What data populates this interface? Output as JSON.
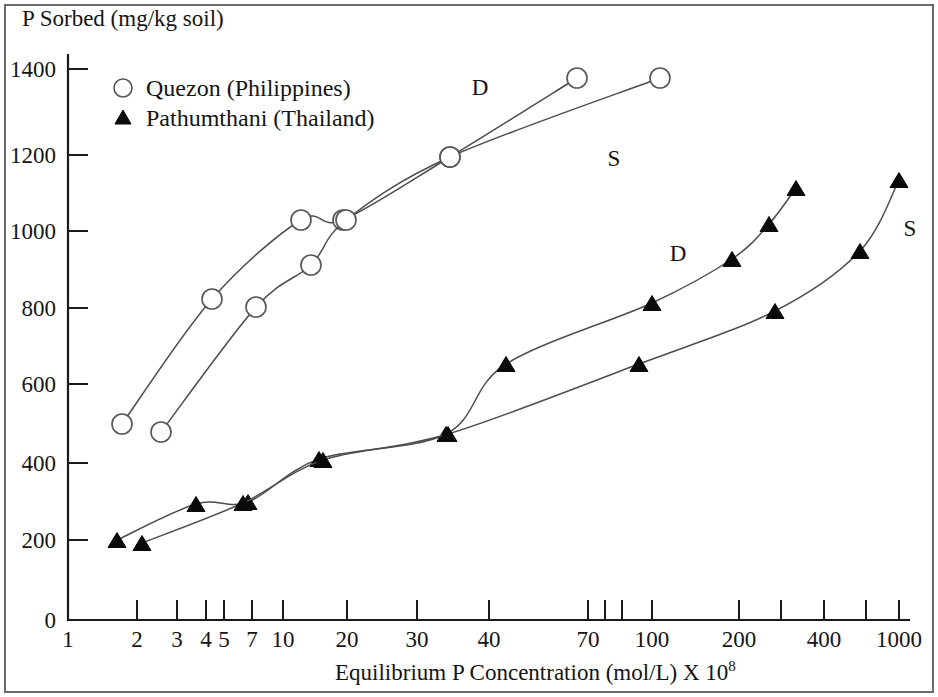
{
  "figure": {
    "y_axis_title": "P Sorbed (mg/kg soil)",
    "x_axis_title_main": "Equilibrium P Concentration (mol/L) X 10",
    "x_axis_title_exponent": "8"
  },
  "legend": {
    "items": [
      {
        "marker": "open-circle-marker",
        "label": "Quezon (Philippines)"
      },
      {
        "marker": "filled-triangle-marker",
        "label": "Pathumthani (Thailand)"
      }
    ]
  },
  "chart_data": {
    "type": "line",
    "title": "",
    "xlabel": "Equilibrium P Concentration (mol/L) X 10^8",
    "ylabel": "P Sorbed (mg/kg soil)",
    "xscale": "log",
    "xlim": [
      1,
      1000
    ],
    "ylim": [
      0,
      1500
    ],
    "grid": false,
    "legend_position": "upper-left",
    "x_ticks": [
      {
        "value": 1,
        "label": "1",
        "px": 68
      },
      {
        "value": 2,
        "label": "2",
        "px": 137
      },
      {
        "value": 3,
        "label": "3",
        "px": 177
      },
      {
        "value": 4,
        "label": "4",
        "px": 206
      },
      {
        "value": 5,
        "label": "5",
        "px": 224
      },
      {
        "value": 7,
        "label": "7",
        "px": 252
      },
      {
        "value": 10,
        "label": "10",
        "px": 283
      },
      {
        "value": 20,
        "label": "20",
        "px": 347
      },
      {
        "value": 30,
        "label": "30",
        "px": 417
      },
      {
        "value": 40,
        "label": "40",
        "px": 489
      },
      {
        "value": 70,
        "label": "70",
        "px": 588
      },
      {
        "value": 100,
        "label": "100",
        "px": 652
      },
      {
        "value": 200,
        "label": "200",
        "px": 739
      },
      {
        "value": 400,
        "label": "400",
        "px": 824
      },
      {
        "value": 1000,
        "label": "1000",
        "px": 899
      }
    ],
    "x_minor_ticks_px": [
      605,
      622,
      781,
      866
    ],
    "y_ticks": [
      {
        "value": 0,
        "label": "0",
        "px": 620
      },
      {
        "value": 200,
        "label": "200",
        "px": 540
      },
      {
        "value": 400,
        "label": "400",
        "px": 463
      },
      {
        "value": 600,
        "label": "600",
        "px": 384
      },
      {
        "value": 800,
        "label": "800",
        "px": 308
      },
      {
        "value": 1000,
        "label": "1000",
        "px": 231
      },
      {
        "value": 1200,
        "label": "1200",
        "px": 155
      },
      {
        "value": 1400,
        "label": "1400",
        "px": 69
      }
    ],
    "series": [
      {
        "name": "Quezon (Philippines) D",
        "soil": "Quezon (Philippines)",
        "curve_label": "D",
        "curve_label_px": [
          480,
          95
        ],
        "marker": "open-circle",
        "points": [
          {
            "x": 1.7,
            "y": 510,
            "px": 122,
            "py": 424
          },
          {
            "x": 4.6,
            "y": 822,
            "px": 212,
            "py": 299
          },
          {
            "x": 12.5,
            "y": 1020,
            "px": 301,
            "py": 220
          },
          {
            "x": 18.5,
            "y": 1022,
            "px": 343,
            "py": 220
          },
          {
            "x": 35,
            "y": 1180,
            "px": 450,
            "py": 157
          },
          {
            "x": 67,
            "y": 1382,
            "px": 577,
            "py": 78
          }
        ]
      },
      {
        "name": "Quezon (Philippines) S",
        "soil": "Quezon (Philippines)",
        "curve_label": "S",
        "curve_label_px": [
          614,
          166
        ],
        "marker": "open-circle",
        "points": [
          {
            "x": 2.5,
            "y": 488,
            "px": 161,
            "py": 432
          },
          {
            "x": 7.2,
            "y": 805,
            "px": 256,
            "py": 307
          },
          {
            "x": 14,
            "y": 910,
            "px": 311,
            "py": 265
          },
          {
            "x": 19,
            "y": 1022,
            "px": 346,
            "py": 220
          },
          {
            "x": 35,
            "y": 1180,
            "px": 450,
            "py": 157
          },
          {
            "x": 101,
            "y": 1380,
            "px": 660,
            "py": 78
          }
        ]
      },
      {
        "name": "Pathumthani (Thailand) D",
        "soil": "Pathumthani (Thailand)",
        "curve_label": "D",
        "curve_label_px": [
          678,
          261
        ],
        "marker": "filled-triangle",
        "points": [
          {
            "x": 1.7,
            "y": 205,
            "px": 117,
            "py": 540
          },
          {
            "x": 3.6,
            "y": 295,
            "px": 196,
            "py": 504
          },
          {
            "x": 7.3,
            "y": 300,
            "px": 248,
            "py": 502
          },
          {
            "x": 15,
            "y": 412,
            "px": 319,
            "py": 459
          },
          {
            "x": 36,
            "y": 475,
            "px": 446,
            "py": 434
          },
          {
            "x": 47,
            "y": 650,
            "px": 506,
            "py": 364
          },
          {
            "x": 100,
            "y": 808,
            "px": 652,
            "py": 303
          },
          {
            "x": 190,
            "y": 920,
            "px": 732,
            "py": 259
          },
          {
            "x": 250,
            "y": 1010,
            "px": 769,
            "py": 224
          },
          {
            "x": 310,
            "y": 1100,
            "px": 796,
            "py": 188
          }
        ]
      },
      {
        "name": "Pathumthani (Thailand) S",
        "soil": "Pathumthani (Thailand)",
        "curve_label": "S",
        "curve_label_px": [
          910,
          236
        ],
        "marker": "filled-triangle",
        "points": [
          {
            "x": 2.1,
            "y": 198,
            "px": 142,
            "py": 543
          },
          {
            "x": 5.2,
            "y": 300,
            "px": 243,
            "py": 503
          },
          {
            "x": 16,
            "y": 410,
            "px": 323,
            "py": 460
          },
          {
            "x": 37,
            "y": 475,
            "px": 448,
            "py": 434
          },
          {
            "x": 95,
            "y": 650,
            "px": 639,
            "py": 364
          },
          {
            "x": 270,
            "y": 788,
            "px": 775,
            "py": 311
          },
          {
            "x": 530,
            "y": 940,
            "px": 860,
            "py": 251
          },
          {
            "x": 980,
            "y": 1120,
            "px": 899,
            "py": 180
          }
        ]
      }
    ]
  }
}
